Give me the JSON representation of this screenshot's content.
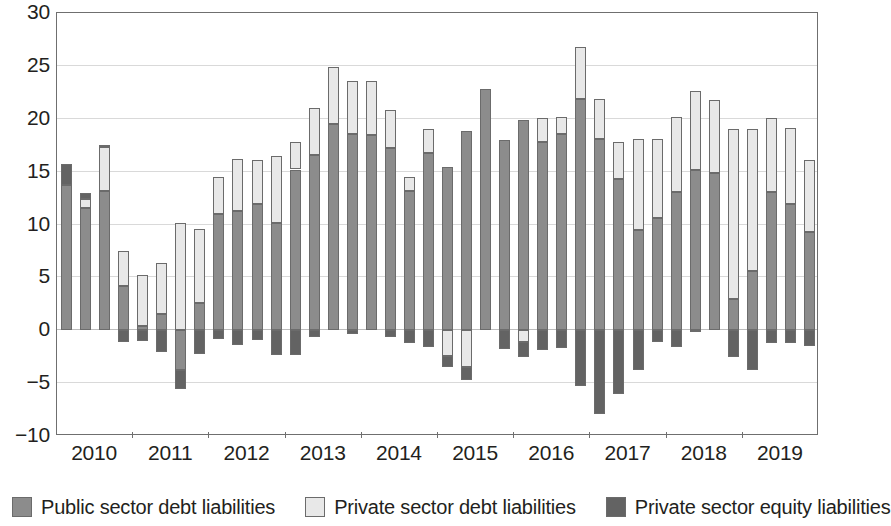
{
  "chart_data": {
    "type": "bar",
    "stacked": true,
    "title": "",
    "subtitle": "",
    "xlabel": "",
    "ylabel": "",
    "ylim": [
      -10,
      30
    ],
    "ytick_values": [
      -10,
      -5,
      0,
      5,
      10,
      15,
      20,
      25,
      30
    ],
    "ytick_labels": [
      "−10",
      "−5",
      "0",
      "5",
      "10",
      "15",
      "20",
      "25",
      "30"
    ],
    "grid": true,
    "legend_position": "bottom",
    "year_labels": [
      "2010",
      "2011",
      "2012",
      "2013",
      "2014",
      "2015",
      "2016",
      "2017",
      "2018",
      "2019"
    ],
    "periods_per_year": 4,
    "x": [
      "2010Q1",
      "2010Q2",
      "2010Q3",
      "2010Q4",
      "2011Q1",
      "2011Q2",
      "2011Q3",
      "2011Q4",
      "2012Q1",
      "2012Q2",
      "2012Q3",
      "2012Q4",
      "2013Q1",
      "2013Q2",
      "2013Q3",
      "2013Q4",
      "2014Q1",
      "2014Q2",
      "2014Q3",
      "2014Q4",
      "2015Q1",
      "2015Q2",
      "2015Q3",
      "2015Q4",
      "2016Q1",
      "2016Q2",
      "2016Q3",
      "2016Q4",
      "2017Q1",
      "2017Q2",
      "2017Q3",
      "2017Q4",
      "2018Q1",
      "2018Q2",
      "2018Q3",
      "2018Q4",
      "2019Q1",
      "2019Q2",
      "2019Q3",
      "2019Q4"
    ],
    "series": [
      {
        "name": "Public sector debt liabilities",
        "color": "#8c8c8c",
        "values": [
          13.7,
          11.6,
          13.2,
          4.2,
          0.4,
          1.5,
          -3.8,
          2.6,
          11.0,
          11.3,
          11.9,
          10.1,
          15.2,
          16.6,
          19.5,
          18.6,
          18.5,
          17.2,
          13.2,
          16.8,
          15.4,
          18.8,
          22.8,
          18.0,
          19.9,
          17.8,
          18.6,
          21.9,
          18.1,
          14.3,
          9.5,
          10.6,
          13.1,
          15.2,
          14.9,
          3.0,
          5.6,
          13.1,
          11.9,
          9.3
        ]
      },
      {
        "name": "Private sector debt liabilities",
        "color": "#e8e8e8",
        "values": [
          0.0,
          0.8,
          4.1,
          3.3,
          4.8,
          4.9,
          10.1,
          7.0,
          3.5,
          4.9,
          4.2,
          6.4,
          2.6,
          4.4,
          5.4,
          5.0,
          5.1,
          3.6,
          1.3,
          2.2,
          -2.4,
          -3.5,
          0.0,
          0.0,
          -1.1,
          2.3,
          1.6,
          4.9,
          3.8,
          3.5,
          8.6,
          7.5,
          7.1,
          7.4,
          6.9,
          16.0,
          13.4,
          7.0,
          7.2,
          6.8
        ]
      },
      {
        "name": "Private sector equity liabilities",
        "color": "#636363",
        "values": [
          2.0,
          0.6,
          0.2,
          -1.1,
          -1.0,
          -2.1,
          -1.8,
          -2.2,
          -0.8,
          -1.4,
          -0.9,
          -2.3,
          -2.3,
          -0.6,
          0.0,
          -0.4,
          0.0,
          -0.6,
          -1.2,
          -1.6,
          -1.1,
          -1.2,
          0.0,
          -1.8,
          -1.4,
          -1.9,
          -1.7,
          -5.3,
          -7.9,
          -6.0,
          -3.8,
          -1.1,
          -1.6,
          -0.2,
          0.0,
          -2.5,
          -3.8,
          -1.2,
          -1.2,
          -1.5
        ]
      }
    ]
  },
  "legend": {
    "items": [
      {
        "label": "Public sector debt liabilities",
        "swatch": "public"
      },
      {
        "label": "Private sector debt liabilities",
        "swatch": "privdebt"
      },
      {
        "label": "Private sector equity liabilities",
        "swatch": "privequity"
      }
    ]
  },
  "colors": {
    "public_debt": "#8c8c8c",
    "private_debt": "#e8e8e8",
    "private_equity": "#636363",
    "axis": "#6f6f6f",
    "grid": "#d9d9d9",
    "text": "#231f20"
  }
}
